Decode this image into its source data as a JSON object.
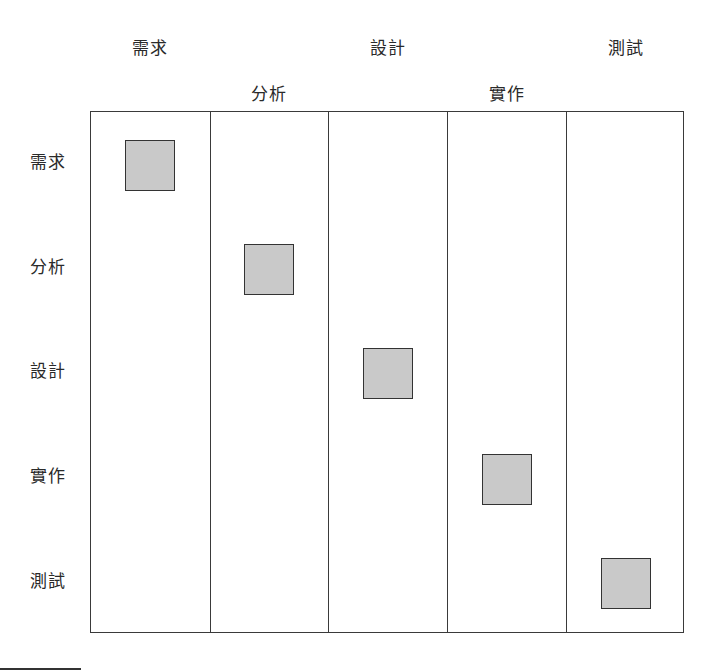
{
  "diagram": {
    "type": "phase-matrix",
    "columns_top_row": [
      {
        "label": "需求",
        "index": 0
      },
      {
        "label": "設計",
        "index": 2
      },
      {
        "label": "測試",
        "index": 4
      }
    ],
    "columns_second_row": [
      {
        "label": "分析",
        "index": 1
      },
      {
        "label": "實作",
        "index": 3
      }
    ],
    "columns": [
      "需求",
      "分析",
      "設計",
      "實作",
      "測試"
    ],
    "rows": [
      "需求",
      "分析",
      "設計",
      "實作",
      "測試"
    ],
    "cells_filled": [
      {
        "row": "需求",
        "column": "需求"
      },
      {
        "row": "分析",
        "column": "分析"
      },
      {
        "row": "設計",
        "column": "設計"
      },
      {
        "row": "實作",
        "column": "實作"
      },
      {
        "row": "測試",
        "column": "測試"
      }
    ],
    "colors": {
      "box_fill": "#c9c9c9",
      "box_border": "#333333",
      "grid_line": "#3a3a3a"
    }
  }
}
